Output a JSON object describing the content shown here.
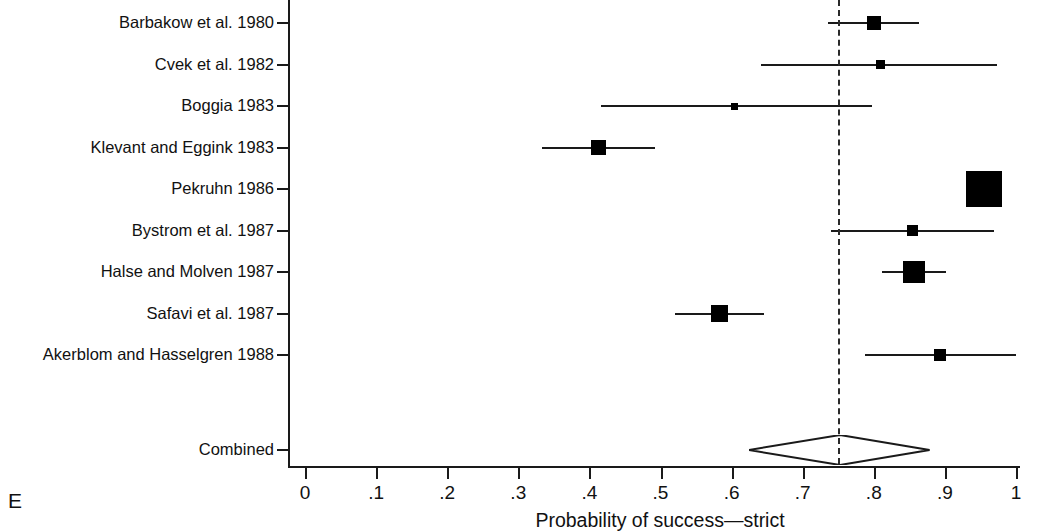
{
  "figure": {
    "panel_letter": "E",
    "xlabel": "Probability of success—strict",
    "reference_line_value": 0.75
  },
  "chart_data": {
    "type": "forest",
    "title": "",
    "xlabel": "Probability of success—strict",
    "ylabel": "",
    "xlim": [
      0,
      1
    ],
    "xticks": [
      0,
      0.1,
      0.2,
      0.3,
      0.4,
      0.5,
      0.6,
      0.7,
      0.8,
      0.9,
      1
    ],
    "xticklabels": [
      "0",
      ".1",
      ".2",
      ".3",
      ".4",
      ".5",
      ".6",
      ".7",
      ".8",
      ".9",
      "1"
    ],
    "grid": false,
    "legend": "none",
    "reference_line": 0.75,
    "studies": [
      {
        "label": "Barbakow et al. 1980",
        "estimate": 0.8,
        "ci_low": 0.735,
        "ci_high": 0.864,
        "marker_size": 14
      },
      {
        "label": "Cvek et al. 1982",
        "estimate": 0.81,
        "ci_low": 0.642,
        "ci_high": 0.973,
        "marker_size": 9
      },
      {
        "label": "Boggia 1983",
        "estimate": 0.604,
        "ci_low": 0.417,
        "ci_high": 0.797,
        "marker_size": 7
      },
      {
        "label": "Klevant and Eggink 1983",
        "estimate": 0.413,
        "ci_low": 0.334,
        "ci_high": 0.492,
        "marker_size": 15
      },
      {
        "label": "Pekruhn 1986",
        "estimate": 0.955,
        "ci_low": 0.93,
        "ci_high": 0.98,
        "marker_size": 36
      },
      {
        "label": "Bystrom et al. 1987",
        "estimate": 0.854,
        "ci_low": 0.74,
        "ci_high": 0.969,
        "marker_size": 11
      },
      {
        "label": "Halse and Molven 1987",
        "estimate": 0.857,
        "ci_low": 0.811,
        "ci_high": 0.902,
        "marker_size": 22
      },
      {
        "label": "Safavi et al. 1987",
        "estimate": 0.583,
        "ci_low": 0.52,
        "ci_high": 0.646,
        "marker_size": 17
      },
      {
        "label": "Akerblom and Hasselgren 1988",
        "estimate": 0.893,
        "ci_low": 0.787,
        "ci_high": 1.0,
        "marker_size": 12
      }
    ],
    "combined": {
      "label": "Combined",
      "estimate": 0.753,
      "ci_low": 0.625,
      "ci_high": 0.879
    }
  }
}
